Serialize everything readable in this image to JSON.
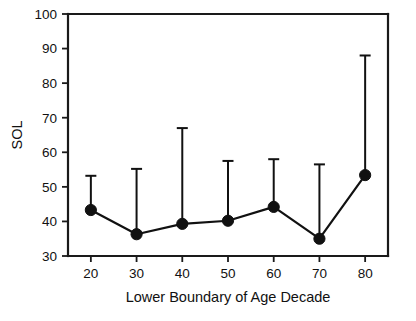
{
  "chart_data": {
    "type": "line",
    "title": "",
    "xlabel": "Lower Boundary of Age Decade",
    "ylabel": "SOL",
    "x": [
      20,
      30,
      40,
      50,
      60,
      70,
      80
    ],
    "values": [
      43.3,
      36.3,
      39.3,
      40.2,
      44.2,
      35.0,
      53.4
    ],
    "error_upper": [
      53.2,
      55.2,
      67.0,
      57.5,
      58.0,
      56.5,
      88.0
    ],
    "xlim": [
      15,
      85
    ],
    "ylim": [
      30,
      100
    ],
    "xticks": [
      20,
      30,
      40,
      50,
      60,
      70,
      80
    ],
    "yticks": [
      30,
      40,
      50,
      60,
      70,
      80,
      90,
      100
    ],
    "xtick_labels": [
      "20",
      "30",
      "40",
      "50",
      "60",
      "70",
      "80"
    ],
    "ytick_labels": [
      "30",
      "40",
      "50",
      "60",
      "70",
      "80",
      "90",
      "100"
    ],
    "grid": false,
    "legend": null,
    "marker": "filled-circle",
    "error_direction": "upper-only",
    "series": [
      {
        "name": "SOL",
        "values": [
          43.3,
          36.3,
          39.3,
          40.2,
          44.2,
          35.0,
          53.4
        ]
      }
    ],
    "colors": {
      "line": "#111111",
      "marker": "#111111",
      "error": "#111111",
      "axis": "#1a1a1a",
      "background": "#ffffff"
    }
  },
  "axes": {
    "y_title": "SOL",
    "x_title": "Lower Boundary of Age Decade"
  }
}
